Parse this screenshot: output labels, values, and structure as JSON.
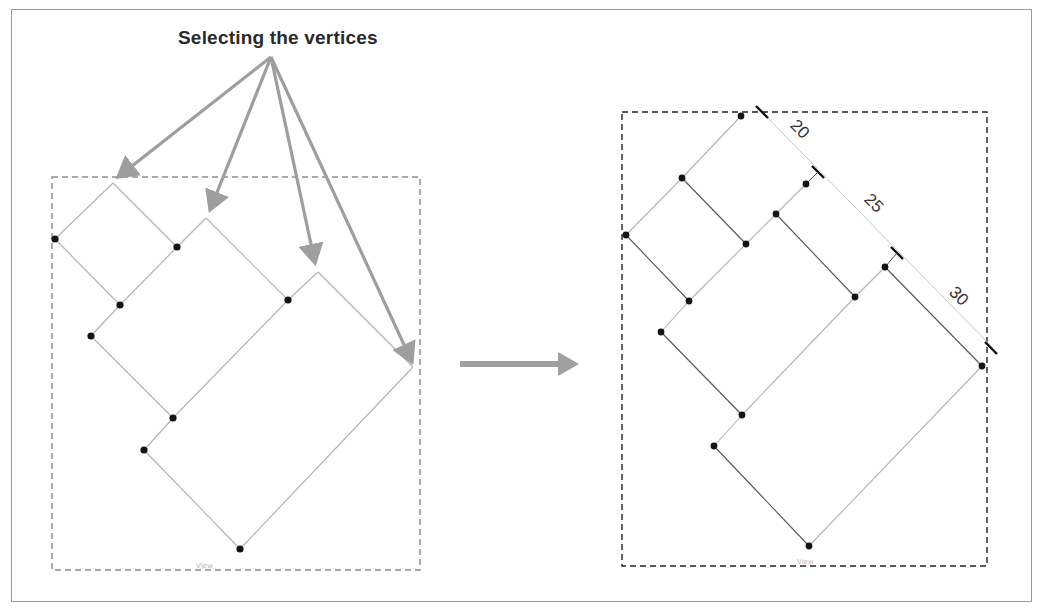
{
  "title": "Selecting the vertices",
  "colors": {
    "frame_border": "#9a9a9a",
    "annotation_arrow": "#9e9e9e",
    "left_box_dash": "#8c8c8c",
    "right_box_dash": "#222222",
    "edge_light": "#b4b4b4",
    "edge_dark": "#555555",
    "vertex": "#141414",
    "dimension_tick": "#111111"
  },
  "left_panel": {
    "label": "Before: vertices selected",
    "view_label": "View",
    "box": {
      "x": 52,
      "y": 177,
      "w": 368,
      "h": 393
    },
    "arrow_origin": [
      271,
      57
    ],
    "arrow_tips": [
      [
        118,
        177
      ],
      [
        210,
        210
      ],
      [
        315,
        263
      ],
      [
        412,
        362
      ]
    ],
    "edges": [
      [
        [
          113,
          183
        ],
        [
          55,
          239
        ]
      ],
      [
        [
          55,
          239
        ],
        [
          120,
          305
        ]
      ],
      [
        [
          113,
          183
        ],
        [
          177,
          247
        ]
      ],
      [
        [
          120,
          305
        ],
        [
          177,
          247
        ]
      ],
      [
        [
          177,
          247
        ],
        [
          206,
          218
        ]
      ],
      [
        [
          206,
          218
        ],
        [
          288,
          300
        ]
      ],
      [
        [
          120,
          305
        ],
        [
          91,
          336
        ]
      ],
      [
        [
          91,
          336
        ],
        [
          173,
          418
        ]
      ],
      [
        [
          173,
          418
        ],
        [
          288,
          300
        ]
      ],
      [
        [
          288,
          300
        ],
        [
          318,
          272
        ]
      ],
      [
        [
          318,
          272
        ],
        [
          413,
          367
        ]
      ],
      [
        [
          173,
          418
        ],
        [
          144,
          450
        ]
      ],
      [
        [
          144,
          450
        ],
        [
          240,
          549
        ]
      ],
      [
        [
          240,
          549
        ],
        [
          413,
          367
        ]
      ]
    ],
    "vertices": [
      [
        55,
        239
      ],
      [
        177,
        247
      ],
      [
        120,
        305
      ],
      [
        91,
        336
      ],
      [
        288,
        300
      ],
      [
        173,
        418
      ],
      [
        144,
        450
      ],
      [
        240,
        549
      ]
    ]
  },
  "transition_arrow": {
    "from": [
      460,
      364
    ],
    "to": [
      580,
      364
    ]
  },
  "right_panel": {
    "label": "After: dimensions applied",
    "view_label": "View",
    "box": {
      "x": 622,
      "y": 112,
      "w": 365,
      "h": 454
    },
    "edges": [
      [
        [
          741,
          116
        ],
        [
          682,
          178
        ]
      ],
      [
        [
          682,
          178
        ],
        [
          626,
          235
        ]
      ],
      [
        [
          626,
          235
        ],
        [
          689,
          301
        ]
      ],
      [
        [
          682,
          178
        ],
        [
          746,
          244
        ]
      ],
      [
        [
          689,
          301
        ],
        [
          746,
          244
        ]
      ],
      [
        [
          746,
          244
        ],
        [
          776,
          214
        ]
      ],
      [
        [
          776,
          214
        ],
        [
          806,
          184
        ]
      ],
      [
        [
          776,
          214
        ],
        [
          855,
          297
        ]
      ],
      [
        [
          689,
          301
        ],
        [
          661,
          332
        ]
      ],
      [
        [
          661,
          332
        ],
        [
          742,
          415
        ]
      ],
      [
        [
          742,
          415
        ],
        [
          855,
          297
        ]
      ],
      [
        [
          855,
          297
        ],
        [
          885,
          267
        ]
      ],
      [
        [
          885,
          267
        ],
        [
          982,
          366
        ]
      ],
      [
        [
          742,
          415
        ],
        [
          714,
          446
        ]
      ],
      [
        [
          714,
          446
        ],
        [
          809,
          546
        ]
      ],
      [
        [
          809,
          546
        ],
        [
          982,
          366
        ]
      ]
    ],
    "vertices": [
      [
        741,
        116
      ],
      [
        682,
        178
      ],
      [
        626,
        235
      ],
      [
        746,
        244
      ],
      [
        806,
        184
      ],
      [
        776,
        214
      ],
      [
        689,
        301
      ],
      [
        661,
        332
      ],
      [
        855,
        297
      ],
      [
        885,
        267
      ],
      [
        742,
        415
      ],
      [
        714,
        446
      ],
      [
        982,
        366
      ],
      [
        809,
        546
      ]
    ],
    "dimension_line": {
      "from": [
        758,
        108
      ],
      "to": [
        993,
        348
      ]
    },
    "dimensions": [
      {
        "value": "20",
        "x": 796,
        "y": 133
      },
      {
        "value": "25",
        "x": 870,
        "y": 207
      },
      {
        "value": "30",
        "x": 955,
        "y": 300
      }
    ],
    "ticks": [
      [
        762,
        112
      ],
      [
        818,
        172
      ],
      [
        897,
        253
      ],
      [
        991,
        348
      ]
    ]
  }
}
